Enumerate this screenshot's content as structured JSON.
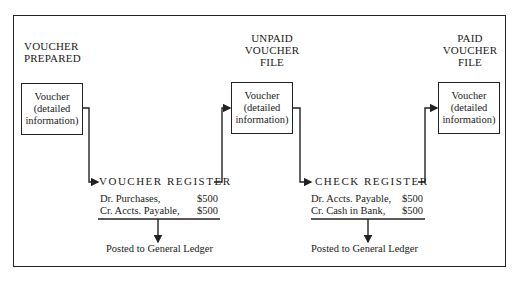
{
  "diagram": {
    "stages": [
      {
        "title_lines": [
          "VOUCHER",
          "PREPARED"
        ]
      },
      {
        "title_lines": [
          "UNPAID",
          "VOUCHER",
          "FILE"
        ]
      },
      {
        "title_lines": [
          "PAID",
          "VOUCHER",
          "FILE"
        ]
      }
    ],
    "voucher_box": {
      "lines": [
        "Voucher",
        "(detailed",
        "information)"
      ]
    },
    "registers": [
      {
        "title": "VOUCHER REGISTER",
        "entries": [
          {
            "label": "Dr. Purchases,",
            "amount": "$500"
          },
          {
            "label": "Cr. Accts. Payable,",
            "amount": "$500"
          }
        ],
        "posted": "Posted to General Ledger"
      },
      {
        "title": "CHECK REGISTER",
        "entries": [
          {
            "label": "Dr. Accts. Payable,",
            "amount": "$500"
          },
          {
            "label": "Cr. Cash in Bank,",
            "amount": "$500"
          }
        ],
        "posted": "Posted to General Ledger"
      }
    ]
  }
}
